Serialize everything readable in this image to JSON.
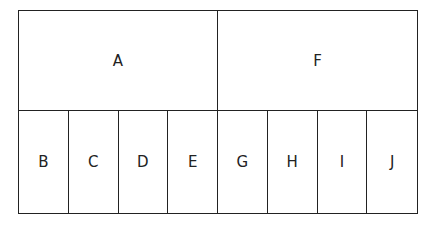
{
  "diagram": {
    "type": "block-partition",
    "top_row": [
      {
        "label": "A",
        "spans": [
          "B",
          "C",
          "D",
          "E"
        ]
      },
      {
        "label": "F",
        "spans": [
          "G",
          "H",
          "I",
          "J"
        ]
      }
    ],
    "bottom_row": [
      "B",
      "C",
      "D",
      "E",
      "G",
      "H",
      "I",
      "J"
    ],
    "colors": {
      "line": "#222222",
      "background": "#ffffff",
      "text": "#222222"
    }
  }
}
